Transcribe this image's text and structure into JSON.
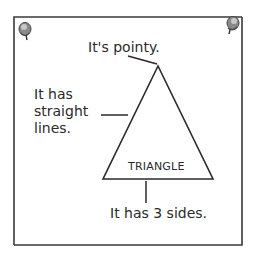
{
  "diagram": {
    "title": "TRIANGLE",
    "labels": {
      "pointy": "It's pointy.",
      "straight_line1": "It has",
      "straight_line2": "straight",
      "straight_line3": "lines.",
      "sides": "It has 3 sides."
    },
    "pins": [
      "pin-top-left",
      "pin-top-right"
    ],
    "colors": {
      "stroke": "#2a2a2a",
      "frame": "#3a3a3a",
      "background": "#ffffff",
      "pin": "#7a7a7a"
    }
  }
}
